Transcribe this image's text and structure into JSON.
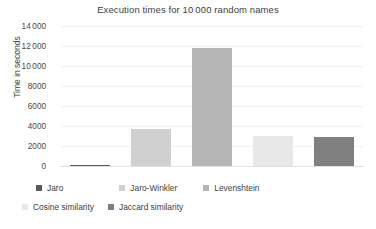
{
  "chart_data": {
    "type": "bar",
    "title": "Execution times for 10 000 random names",
    "xlabel": "",
    "ylabel": "Time in seconds",
    "ylim": [
      0,
      14000
    ],
    "grid": true,
    "legend_position": "bottom",
    "categories": [
      "Jaro",
      "Jaro-Winkler",
      "Levenshtein",
      "Cosine similarity",
      "Jaccard similarity"
    ],
    "values": [
      100,
      3700,
      11800,
      3020,
      2900
    ],
    "colors": [
      "#595959",
      "#d0d0d0",
      "#b5b5b5",
      "#e8e8e8",
      "#808080"
    ],
    "ytick_labels": [
      "14 000",
      "12 000",
      "10 000",
      "8000",
      "6000",
      "4000",
      "2000",
      "0"
    ],
    "ytick_values": [
      14000,
      12000,
      10000,
      8000,
      6000,
      4000,
      2000,
      0
    ]
  },
  "legend": {
    "rows": [
      [
        {
          "label": "Jaro",
          "color": "#595959"
        },
        {
          "label": "Jaro-Winkler",
          "color": "#d0d0d0"
        },
        {
          "label": "Levenshtein",
          "color": "#b5b5b5"
        }
      ],
      [
        {
          "label": "Cosine similarity",
          "color": "#e8e8e8"
        },
        {
          "label": "Jaccard similarity",
          "color": "#808080"
        }
      ]
    ]
  }
}
